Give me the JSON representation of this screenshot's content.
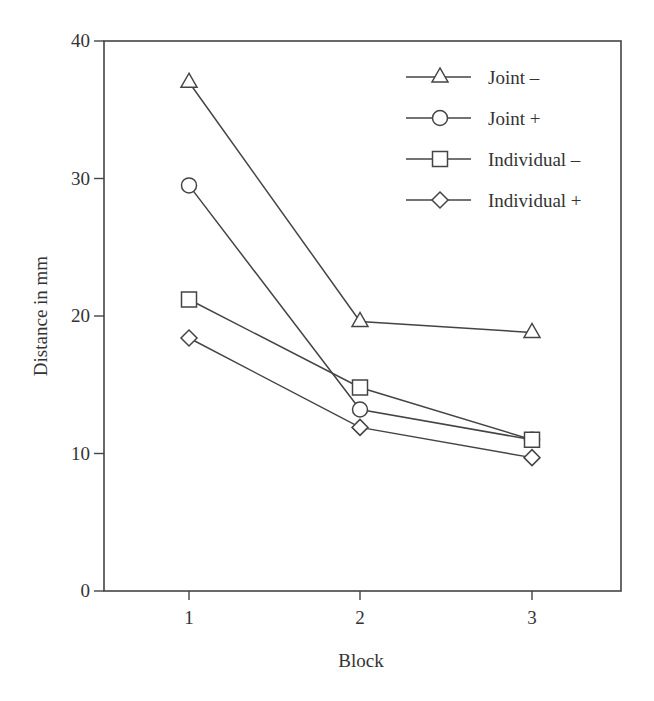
{
  "chart_data": {
    "type": "line",
    "title": "",
    "xlabel": "Block",
    "ylabel": "Distance in mm",
    "x": [
      1,
      2,
      3
    ],
    "x_ticks": [
      "1",
      "2",
      "3"
    ],
    "y_ticks": [
      "0",
      "10",
      "20",
      "30",
      "40"
    ],
    "ylim": [
      0,
      40
    ],
    "grid": false,
    "legend_position": "upper right (inside)",
    "series": [
      {
        "name": "Joint –",
        "marker": "triangle",
        "values": [
          37.0,
          19.6,
          18.8
        ]
      },
      {
        "name": "Joint +",
        "marker": "circle",
        "values": [
          29.5,
          13.2,
          11.0
        ]
      },
      {
        "name": "Individual –",
        "marker": "square",
        "values": [
          21.2,
          14.8,
          11.0
        ]
      },
      {
        "name": "Individual +",
        "marker": "diamond",
        "values": [
          18.4,
          11.9,
          9.7
        ]
      }
    ]
  },
  "colors": {
    "line": "#444444",
    "text": "#333333"
  }
}
